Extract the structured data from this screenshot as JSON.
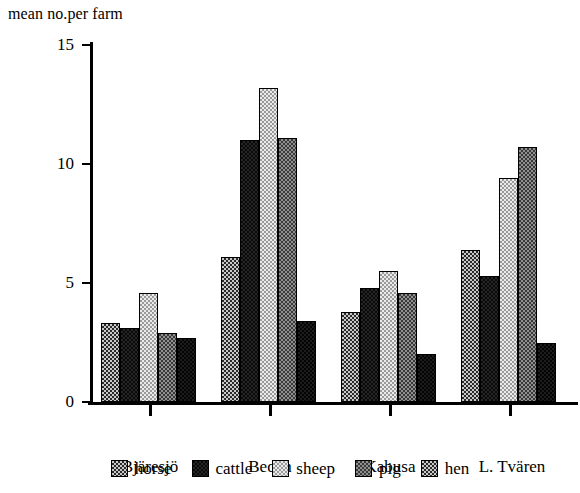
{
  "chart_data": {
    "type": "bar",
    "title": "mean no.per farm",
    "xlabel": "",
    "ylabel": "",
    "ylim": [
      0,
      15
    ],
    "yticks": [
      0,
      5,
      10,
      15
    ],
    "grid": false,
    "legend_position": "bottom",
    "categories": [
      "Bjäresjö",
      "Beden",
      "Kabusa",
      "L. Tvären"
    ],
    "series": [
      {
        "name": "horse",
        "values": [
          3.3,
          6.1,
          3.8,
          6.4
        ]
      },
      {
        "name": "cattle",
        "values": [
          3.1,
          11.0,
          4.8,
          5.3
        ]
      },
      {
        "name": "sheep",
        "values": [
          4.6,
          13.2,
          5.5,
          9.4
        ]
      },
      {
        "name": "pig",
        "values": [
          2.9,
          11.1,
          4.6,
          10.7
        ]
      },
      {
        "name": "hen",
        "values": [
          2.7,
          3.4,
          2.0,
          2.5
        ]
      }
    ]
  },
  "axis": {
    "y_tick_labels": [
      "15",
      "10",
      "5",
      "0"
    ],
    "x_tick_labels": [
      "Bjäresjö",
      "Beden",
      "Kabusa",
      "L. Tvären"
    ]
  },
  "legend": {
    "items": [
      {
        "label": "horse",
        "pattern": "medium-checker-swatch"
      },
      {
        "label": "cattle",
        "pattern": "solid-black-swatch"
      },
      {
        "label": "sheep",
        "pattern": "light-checker-swatch"
      },
      {
        "label": "pig",
        "pattern": "dark-checker-swatch"
      },
      {
        "label": "hen",
        "pattern": "medium-checker-swatch"
      }
    ]
  }
}
